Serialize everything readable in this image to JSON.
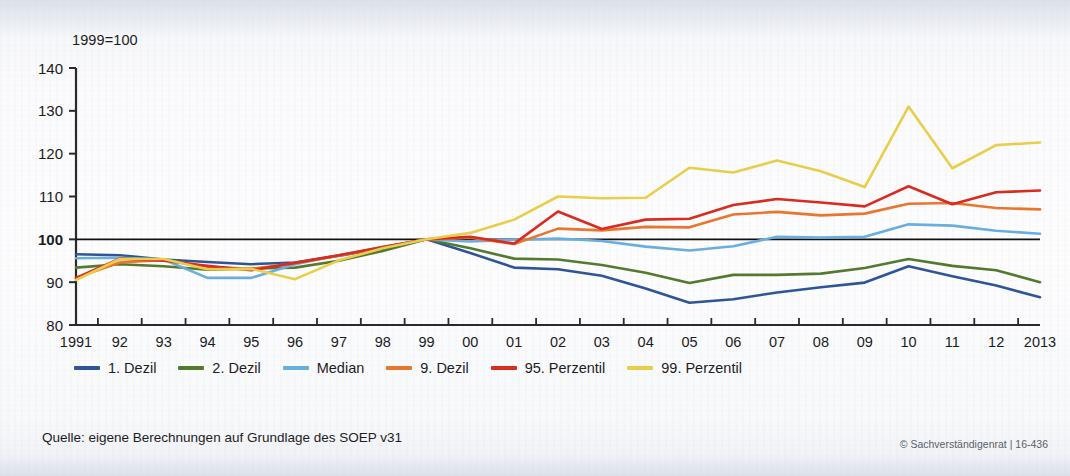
{
  "axis_unit_note": "1999=100",
  "source_note": "Quelle: eigene Berechnungen auf Grundlage des SOEP v31",
  "copyright_note": "© Sachverständigenrat | 16-436",
  "colors": {
    "dezil1": "#2f5597",
    "dezil2": "#547a2e",
    "median": "#6aaee0",
    "dezil9": "#e8762c",
    "perzentil95": "#d92b1f",
    "perzentil99": "#e9ce4a",
    "axis": "#2a2a2a",
    "baseline": "#111111",
    "background": "#fbfbfd"
  },
  "legend": {
    "items": [
      {
        "label": "1. Dezil",
        "color_key": "dezil1"
      },
      {
        "label": "2. Dezil",
        "color_key": "dezil2"
      },
      {
        "label": "Median",
        "color_key": "median"
      },
      {
        "label": "9. Dezil",
        "color_key": "dezil9"
      },
      {
        "label": "95. Perzentil",
        "color_key": "perzentil95"
      },
      {
        "label": "99. Perzentil",
        "color_key": "perzentil99"
      }
    ]
  },
  "chart_data": {
    "type": "line",
    "title": "",
    "subtitle": "",
    "xlabel": "",
    "ylabel": "1999=100",
    "grid": false,
    "legend_position": "bottom-left",
    "ylim": [
      80,
      140
    ],
    "yticks": [
      80,
      90,
      100,
      110,
      120,
      130,
      140
    ],
    "baseline_value": 100,
    "x": [
      1991,
      1992,
      1993,
      1994,
      1995,
      1996,
      1997,
      1998,
      1999,
      2000,
      2001,
      2002,
      2003,
      2004,
      2005,
      2006,
      2007,
      2008,
      2009,
      2010,
      2011,
      2012,
      2013
    ],
    "xtick_labels": [
      "1991",
      "92",
      "93",
      "94",
      "95",
      "96",
      "97",
      "98",
      "99",
      "00",
      "01",
      "02",
      "03",
      "04",
      "05",
      "06",
      "07",
      "08",
      "09",
      "10",
      "11",
      "12",
      "2013"
    ],
    "series": [
      {
        "name": "1. Dezil",
        "color_key": "dezil1",
        "values": [
          96.5,
          96.3,
          95.3,
          94.7,
          94.2,
          94.6,
          96.2,
          97.8,
          100.0,
          96.8,
          93.4,
          93.0,
          91.5,
          88.5,
          85.2,
          86.0,
          87.6,
          88.8,
          89.9,
          93.7,
          91.4,
          89.2,
          86.5
        ]
      },
      {
        "name": "2. Dezil",
        "color_key": "dezil2",
        "values": [
          93.4,
          94.2,
          93.7,
          92.9,
          93.2,
          93.4,
          95.0,
          97.3,
          100.0,
          97.9,
          95.5,
          95.3,
          94.0,
          92.2,
          89.8,
          91.7,
          91.7,
          92.0,
          93.3,
          95.4,
          93.8,
          92.8,
          90.0
        ]
      },
      {
        "name": "Median",
        "color_key": "median",
        "values": [
          95.6,
          95.7,
          95.3,
          91.0,
          91.0,
          94.2,
          96.3,
          98.2,
          100.0,
          99.5,
          99.9,
          100.2,
          99.6,
          98.3,
          97.4,
          98.4,
          100.6,
          100.4,
          100.6,
          103.5,
          103.2,
          102.0,
          101.3
        ]
      },
      {
        "name": "9. Dezil",
        "color_key": "dezil9",
        "values": [
          91.0,
          94.6,
          95.2,
          93.6,
          93.1,
          94.4,
          96.2,
          98.1,
          100.0,
          100.4,
          98.9,
          102.5,
          102.1,
          102.9,
          102.8,
          105.8,
          106.4,
          105.6,
          106.0,
          108.3,
          108.5,
          107.3,
          107.0
        ]
      },
      {
        "name": "95. Perzentil",
        "color_key": "perzentil95",
        "values": [
          91.0,
          95.5,
          95.0,
          93.8,
          92.8,
          94.5,
          96.3,
          98.2,
          100.0,
          100.6,
          99.0,
          106.5,
          102.4,
          104.6,
          104.8,
          108.0,
          109.4,
          108.6,
          107.7,
          112.4,
          108.2,
          111.0,
          111.4
        ]
      },
      {
        "name": "99. Perzentil",
        "color_key": "perzentil99",
        "values": [
          90.5,
          95.4,
          95.4,
          93.0,
          93.1,
          90.7,
          95.1,
          97.9,
          100.0,
          101.5,
          104.6,
          110.0,
          109.6,
          109.7,
          116.7,
          115.6,
          118.4,
          115.9,
          112.2,
          131.0,
          116.6,
          122.0,
          122.6
        ]
      }
    ]
  }
}
